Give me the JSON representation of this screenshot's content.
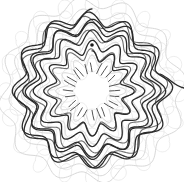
{
  "canvas": {
    "width": 184,
    "height": 182,
    "background_color": "#ffffff",
    "title": "Spiral Rosette Line Drawing"
  },
  "palette": {
    "ink_dark": "#2b2b2b",
    "ink_mid": "#6e6e6e",
    "ink_light": "#d8d8d8",
    "ink_faint": "#e9e9e9",
    "background": "#ffffff"
  },
  "chart_data": {
    "type": "line",
    "xlabel": "",
    "ylabel": "",
    "grid": false,
    "legend_position": "none",
    "center": {
      "x": 92,
      "y": 91
    },
    "layers": [
      {
        "name": "faint-petal-lattice",
        "color": "#e9e9e9",
        "stroke_width": 0.8,
        "type": "petal-loops",
        "rings": 5,
        "lobes": 12,
        "radii": [
          26,
          44,
          60,
          74,
          86
        ],
        "loop_radius": 7
      },
      {
        "name": "light-rosette-spiral",
        "color": "#d8d8d8",
        "stroke_width": 1.0,
        "type": "rosette",
        "lobes": 12,
        "radii": [
          30,
          48,
          64,
          78,
          88
        ]
      },
      {
        "name": "mid-rosette-spiral",
        "color": "#6e6e6e",
        "stroke_width": 1.1,
        "type": "rosette",
        "lobes": 12,
        "radii": [
          38,
          56,
          70
        ]
      },
      {
        "name": "dark-rosette-spiral",
        "color": "#2b2b2b",
        "stroke_width": 1.3,
        "type": "rosette-spiral",
        "lobes": 12,
        "turns": 4,
        "radius_start": 34,
        "radius_end": 76,
        "amplitude": 6
      },
      {
        "name": "radial-tick-dashes",
        "color": "#555555",
        "stroke_width": 1.0,
        "count": 24,
        "inner_radius": 17,
        "outer_radius": 27
      }
    ],
    "markers": [
      {
        "name": "terminal-dot",
        "x": 92,
        "y": 45,
        "radius": 1.8,
        "color": "#1a1a1a"
      }
    ],
    "tail": {
      "name": "exit-tail",
      "from": {
        "x": 160,
        "y": 74
      },
      "to": {
        "x": 184,
        "y": 88
      },
      "color": "#2b2b2b"
    },
    "bounds": {
      "dark_pattern": {
        "left": 14,
        "top": 14,
        "right": 170,
        "bottom": 166
      },
      "light_pattern": {
        "left": 6,
        "top": 8,
        "right": 178,
        "bottom": 178
      }
    }
  }
}
